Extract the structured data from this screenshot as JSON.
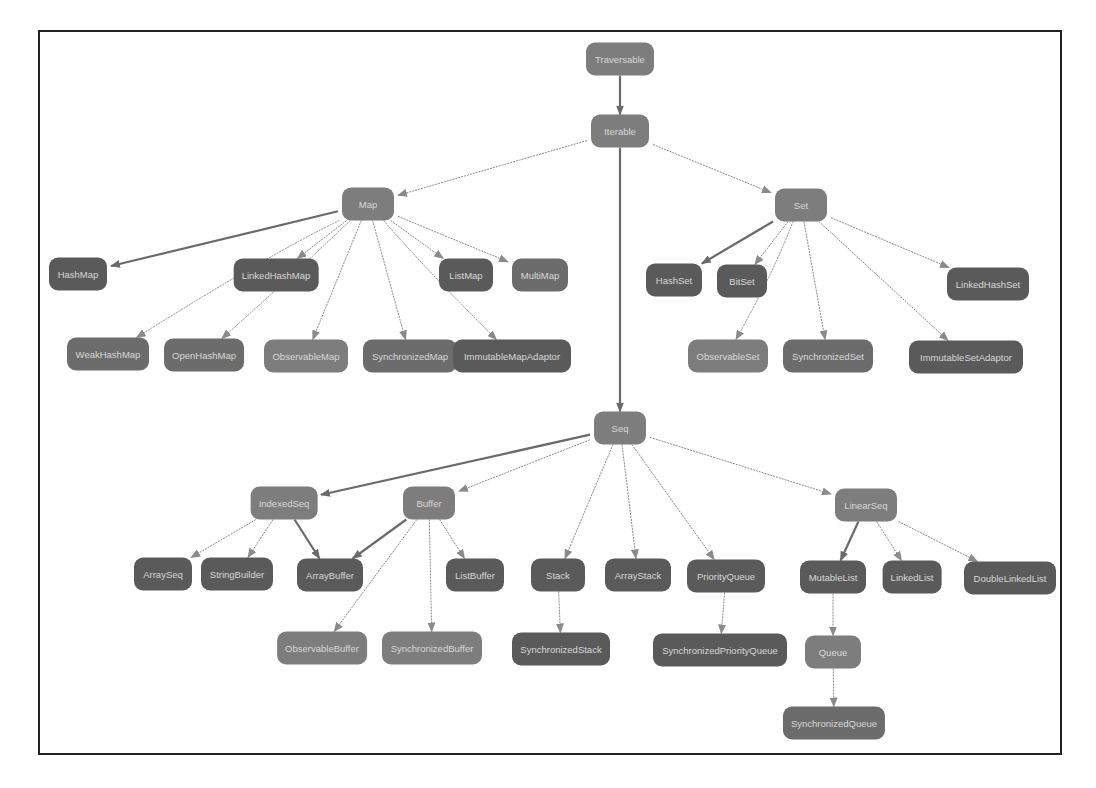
{
  "diagram": {
    "type": "class-hierarchy",
    "colors": {
      "trait": "#7d7d7d",
      "concrete": "#5a5a5a",
      "mid": "#6c6c6c",
      "edge": "#8a8a8a",
      "edge_strong": "#6a6a6a",
      "border": "#222222"
    },
    "nodes": [
      {
        "id": "traversable",
        "label": "Traversable",
        "x": 620,
        "y": 59,
        "w": 68,
        "kind": "trait"
      },
      {
        "id": "iterable",
        "label": "Iterable",
        "x": 620,
        "y": 131,
        "w": 58,
        "kind": "trait"
      },
      {
        "id": "map",
        "label": "Map",
        "x": 368,
        "y": 204,
        "w": 52,
        "kind": "trait"
      },
      {
        "id": "set",
        "label": "Set",
        "x": 801,
        "y": 205,
        "w": 52,
        "kind": "trait"
      },
      {
        "id": "hashmap",
        "label": "HashMap",
        "x": 78,
        "y": 274,
        "w": 58,
        "kind": "concrete"
      },
      {
        "id": "linkedhashmap",
        "label": "LinkedHashMap",
        "x": 276,
        "y": 275,
        "w": 84,
        "kind": "concrete"
      },
      {
        "id": "listmap",
        "label": "ListMap",
        "x": 466,
        "y": 275,
        "w": 54,
        "kind": "concrete"
      },
      {
        "id": "multimap",
        "label": "MultiMap",
        "x": 540,
        "y": 275,
        "w": 56,
        "kind": "mid"
      },
      {
        "id": "weakhashmap",
        "label": "WeakHashMap",
        "x": 108,
        "y": 354,
        "w": 82,
        "kind": "mid"
      },
      {
        "id": "openhashmap",
        "label": "OpenHashMap",
        "x": 204,
        "y": 355,
        "w": 78,
        "kind": "mid"
      },
      {
        "id": "observablemap",
        "label": "ObservableMap",
        "x": 306,
        "y": 356,
        "w": 84,
        "kind": "trait"
      },
      {
        "id": "synchronizedmap",
        "label": "SynchronizedMap",
        "x": 410,
        "y": 356,
        "w": 94,
        "kind": "mid"
      },
      {
        "id": "immutablemapadaptor",
        "label": "ImmutableMapAdaptor",
        "x": 512,
        "y": 356,
        "w": 118,
        "kind": "concrete"
      },
      {
        "id": "hashset",
        "label": "HashSet",
        "x": 674,
        "y": 280,
        "w": 56,
        "kind": "concrete"
      },
      {
        "id": "bitset",
        "label": "BitSet",
        "x": 742,
        "y": 281,
        "w": 50,
        "kind": "concrete"
      },
      {
        "id": "linkedhashset",
        "label": "LinkedHashSet",
        "x": 988,
        "y": 284,
        "w": 82,
        "kind": "concrete"
      },
      {
        "id": "observableset",
        "label": "ObservableSet",
        "x": 728,
        "y": 356,
        "w": 80,
        "kind": "trait"
      },
      {
        "id": "synchronizedset",
        "label": "SynchronizedSet",
        "x": 828,
        "y": 356,
        "w": 90,
        "kind": "mid"
      },
      {
        "id": "immutablesetadaptor",
        "label": "ImmutableSetAdaptor",
        "x": 966,
        "y": 357,
        "w": 114,
        "kind": "concrete"
      },
      {
        "id": "seq",
        "label": "Seq",
        "x": 620,
        "y": 428,
        "w": 52,
        "kind": "trait"
      },
      {
        "id": "indexedseq",
        "label": "IndexedSeq",
        "x": 284,
        "y": 503,
        "w": 66,
        "kind": "trait"
      },
      {
        "id": "buffer",
        "label": "Buffer",
        "x": 429,
        "y": 503,
        "w": 52,
        "kind": "trait"
      },
      {
        "id": "linearseq",
        "label": "LinearSeq",
        "x": 866,
        "y": 505,
        "w": 62,
        "kind": "trait"
      },
      {
        "id": "arrayseq",
        "label": "ArraySeq",
        "x": 163,
        "y": 574,
        "w": 58,
        "kind": "concrete"
      },
      {
        "id": "stringbuilder",
        "label": "StringBuilder",
        "x": 237,
        "y": 574,
        "w": 72,
        "kind": "concrete"
      },
      {
        "id": "arraybuffer",
        "label": "ArrayBuffer",
        "x": 330,
        "y": 575,
        "w": 66,
        "kind": "concrete"
      },
      {
        "id": "listbuffer",
        "label": "ListBuffer",
        "x": 475,
        "y": 575,
        "w": 58,
        "kind": "concrete"
      },
      {
        "id": "stack",
        "label": "Stack",
        "x": 558,
        "y": 575,
        "w": 54,
        "kind": "concrete"
      },
      {
        "id": "arraystack",
        "label": "ArrayStack",
        "x": 638,
        "y": 575,
        "w": 66,
        "kind": "concrete"
      },
      {
        "id": "priorityqueue",
        "label": "PriorityQueue",
        "x": 726,
        "y": 576,
        "w": 78,
        "kind": "concrete"
      },
      {
        "id": "mutablelist",
        "label": "MutableList",
        "x": 833,
        "y": 577,
        "w": 66,
        "kind": "concrete"
      },
      {
        "id": "linkedlist",
        "label": "LinkedList",
        "x": 912,
        "y": 577,
        "w": 58,
        "kind": "concrete"
      },
      {
        "id": "doublelinkedlist",
        "label": "DoubleLinkedList",
        "x": 1010,
        "y": 578,
        "w": 92,
        "kind": "concrete"
      },
      {
        "id": "observablebuffer",
        "label": "ObservableBuffer",
        "x": 322,
        "y": 648,
        "w": 88,
        "kind": "trait"
      },
      {
        "id": "synchronizedbuffer",
        "label": "SynchronizedBuffer",
        "x": 432,
        "y": 648,
        "w": 100,
        "kind": "trait"
      },
      {
        "id": "synchronizedstack",
        "label": "SynchronizedStack",
        "x": 561,
        "y": 649,
        "w": 98,
        "kind": "concrete"
      },
      {
        "id": "synchronizedpriorityqueue",
        "label": "SynchronizedPriorityQueue",
        "x": 720,
        "y": 650,
        "w": 134,
        "kind": "concrete"
      },
      {
        "id": "queue",
        "label": "Queue",
        "x": 833,
        "y": 652,
        "w": 56,
        "kind": "trait"
      },
      {
        "id": "synchronizedqueue",
        "label": "SynchronizedQueue",
        "x": 834,
        "y": 723,
        "w": 102,
        "kind": "mid"
      }
    ],
    "edges": [
      {
        "from": "traversable",
        "to": "iterable",
        "strong": true
      },
      {
        "from": "iterable",
        "to": "map"
      },
      {
        "from": "iterable",
        "to": "set"
      },
      {
        "from": "iterable",
        "to": "seq",
        "strong": true
      },
      {
        "from": "map",
        "to": "hashmap",
        "strong": true
      },
      {
        "from": "map",
        "to": "weakhashmap",
        "curve": true
      },
      {
        "from": "map",
        "to": "openhashmap",
        "curve": true
      },
      {
        "from": "map",
        "to": "linkedhashmap"
      },
      {
        "from": "map",
        "to": "observablemap"
      },
      {
        "from": "map",
        "to": "synchronizedmap"
      },
      {
        "from": "map",
        "to": "immutablemapadaptor",
        "curve": true
      },
      {
        "from": "map",
        "to": "listmap"
      },
      {
        "from": "map",
        "to": "multimap"
      },
      {
        "from": "set",
        "to": "hashset",
        "strong": true
      },
      {
        "from": "set",
        "to": "bitset"
      },
      {
        "from": "set",
        "to": "observableset",
        "curve": true
      },
      {
        "from": "set",
        "to": "synchronizedset"
      },
      {
        "from": "set",
        "to": "immutablesetadaptor"
      },
      {
        "from": "set",
        "to": "linkedhashset"
      },
      {
        "from": "seq",
        "to": "indexedseq",
        "strong": true
      },
      {
        "from": "seq",
        "to": "buffer"
      },
      {
        "from": "seq",
        "to": "stack"
      },
      {
        "from": "seq",
        "to": "arraystack"
      },
      {
        "from": "seq",
        "to": "priorityqueue"
      },
      {
        "from": "seq",
        "to": "linearseq"
      },
      {
        "from": "indexedseq",
        "to": "arrayseq"
      },
      {
        "from": "indexedseq",
        "to": "stringbuilder"
      },
      {
        "from": "indexedseq",
        "to": "arraybuffer",
        "strong": true
      },
      {
        "from": "buffer",
        "to": "arraybuffer",
        "strong": true
      },
      {
        "from": "buffer",
        "to": "listbuffer"
      },
      {
        "from": "buffer",
        "to": "observablebuffer"
      },
      {
        "from": "buffer",
        "to": "synchronizedbuffer"
      },
      {
        "from": "stack",
        "to": "synchronizedstack"
      },
      {
        "from": "priorityqueue",
        "to": "synchronizedpriorityqueue"
      },
      {
        "from": "linearseq",
        "to": "mutablelist",
        "strong": true
      },
      {
        "from": "linearseq",
        "to": "linkedlist"
      },
      {
        "from": "linearseq",
        "to": "doublelinkedlist"
      },
      {
        "from": "mutablelist",
        "to": "queue"
      },
      {
        "from": "queue",
        "to": "synchronizedqueue"
      }
    ]
  }
}
